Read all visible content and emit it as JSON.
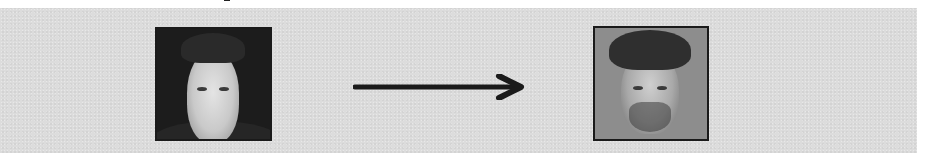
{
  "figure": {
    "type": "face-transformation-diagram",
    "clipped_title_fragment": "",
    "panel_background": "#dcdcdc",
    "source_image": {
      "label": "source-face-photo",
      "description": "Grayscale headshot of a clean-shaven man with short dark hair, dark background",
      "frame_color": "#1a1a1a"
    },
    "arrow": {
      "direction": "right",
      "color": "#1a1a1a"
    },
    "target_image": {
      "label": "target-face-photo",
      "description": "Grayscale headshot of a man with dark wavy hair and stubble beard, gray background",
      "frame_color": "#1a1a1a"
    }
  }
}
